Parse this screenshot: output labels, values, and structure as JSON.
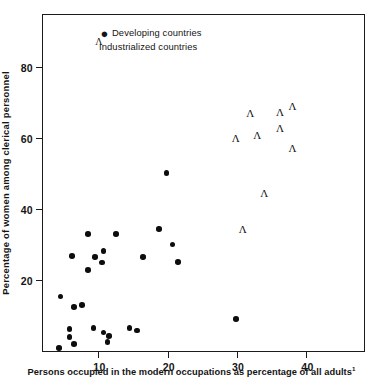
{
  "chart_data": {
    "type": "scatter",
    "title": "",
    "xlabel": "Persons occupied in the modern occupations as percentage of all adults",
    "xlabel_footnote": "1",
    "ylabel": "Percentage of women among clerical personnel",
    "xlim": [
      2.0,
      48.3
    ],
    "ylim": [
      0.0,
      94.5
    ],
    "xticks": [
      10,
      20,
      30,
      40
    ],
    "ytick_labels": [
      "20",
      "40",
      "60",
      "80"
    ],
    "xtick_labels": [
      "10",
      "20",
      "30",
      "40"
    ],
    "yticks": [
      20,
      40,
      60,
      80
    ],
    "grid": false,
    "legend_position": "top-left",
    "marker_color": "#0d0d0d",
    "axis_color": "#1b1b1b",
    "series": [
      {
        "name": "Developing countries",
        "marker": "filled-circle",
        "symbol": "●",
        "points": [
          [
            4.3,
            0.8
          ],
          [
            5.8,
            3.9
          ],
          [
            6.5,
            1.9
          ],
          [
            5.8,
            6.2
          ],
          [
            4.5,
            15.3
          ],
          [
            6.5,
            12.4
          ],
          [
            7.6,
            13.0
          ],
          [
            9.3,
            6.5
          ],
          [
            10.7,
            5.2
          ],
          [
            11.5,
            4.3
          ],
          [
            11.3,
            2.6
          ],
          [
            14.5,
            6.5
          ],
          [
            15.6,
            5.8
          ],
          [
            6.2,
            26.8
          ],
          [
            8.5,
            22.8
          ],
          [
            8.5,
            32.9
          ],
          [
            9.5,
            26.5
          ],
          [
            10.7,
            28.2
          ],
          [
            10.5,
            24.9
          ],
          [
            12.5,
            32.9
          ],
          [
            16.4,
            26.5
          ],
          [
            18.7,
            34.3
          ],
          [
            19.8,
            50.1
          ],
          [
            20.7,
            30.0
          ],
          [
            21.5,
            25.0
          ],
          [
            29.8,
            9.0
          ]
        ]
      },
      {
        "name": "Industrialized countries",
        "marker": "caret",
        "symbol": "Λ",
        "points": [
          [
            29.8,
            59.8
          ],
          [
            31.9,
            67.0
          ],
          [
            32.9,
            60.8
          ],
          [
            36.2,
            67.3
          ],
          [
            36.2,
            62.6
          ],
          [
            38.0,
            68.8
          ],
          [
            38.0,
            57.1
          ],
          [
            33.9,
            44.5
          ],
          [
            30.8,
            34.2
          ]
        ]
      }
    ]
  },
  "legend": {
    "items": [
      {
        "symbol": "●",
        "label": "Developing countries"
      },
      {
        "symbol": "Λ",
        "label": "Industrialized countries"
      }
    ]
  }
}
